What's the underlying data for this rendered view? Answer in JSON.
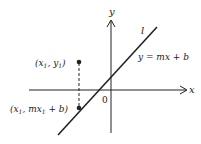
{
  "diagram": {
    "axes": {
      "x_label": "x",
      "y_label": "y",
      "origin_label": "0"
    },
    "line": {
      "name": "l",
      "equation": "y = mx + b"
    },
    "points": [
      {
        "label_main": "(x",
        "sub": "1",
        "label_mid": ", y",
        "sub2": "1",
        "label_end": ")"
      },
      {
        "label_main": "(x",
        "sub": "1",
        "label_mid": ", mx",
        "sub2": "1",
        "label_end": " + b)"
      }
    ],
    "colors": {
      "ink": "#222222",
      "background": "#ffffff"
    }
  }
}
